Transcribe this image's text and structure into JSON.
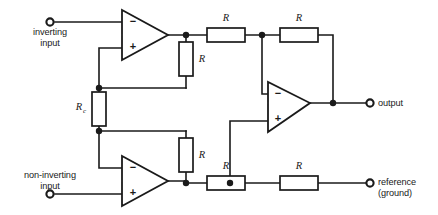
{
  "diagram": {
    "background_color": "#ffffff",
    "line_color": "#1a1a1a"
  },
  "ports": [
    {
      "id": "inverting-input",
      "label": "inverting\ninput",
      "label_lines": [
        "inverting",
        "input"
      ],
      "x": 50,
      "y": 22,
      "label_align": "center"
    },
    {
      "id": "non-inverting-input",
      "label": "non-inverting\ninput",
      "label_lines": [
        "non-inverting",
        "input"
      ],
      "x": 50,
      "y": 194,
      "label_align": "center"
    },
    {
      "id": "output",
      "label": "output",
      "label_lines": [
        "output"
      ],
      "x": 371,
      "y": 103,
      "label_align": "left"
    },
    {
      "id": "reference-ground",
      "label": "reference\n(ground)",
      "label_lines": [
        "reference",
        "(ground)"
      ],
      "x": 371,
      "y": 183,
      "label_align": "left"
    }
  ],
  "opamps": [
    {
      "id": "opamp-top",
      "minus": "−",
      "plus": "+",
      "minus_on_top": true
    },
    {
      "id": "opamp-bottom",
      "minus": "−",
      "plus": "+",
      "minus_on_top": true
    },
    {
      "id": "opamp-output",
      "minus": "−",
      "plus": "+",
      "minus_on_top": true
    }
  ],
  "resistors": [
    {
      "id": "r-top-feedback",
      "label": "R",
      "sub": "",
      "orientation": "vertical"
    },
    {
      "id": "r-gain",
      "label": "R",
      "sub": "c",
      "orientation": "vertical"
    },
    {
      "id": "r-bottom-feedback",
      "label": "R",
      "sub": "",
      "orientation": "vertical"
    },
    {
      "id": "r-top-input",
      "label": "R",
      "sub": "",
      "orientation": "horizontal"
    },
    {
      "id": "r-top-feedback-2",
      "label": "R",
      "sub": "",
      "orientation": "horizontal"
    },
    {
      "id": "r-bottom-input",
      "label": "R",
      "sub": "",
      "orientation": "horizontal"
    },
    {
      "id": "r-bottom-ref",
      "label": "R",
      "sub": "",
      "orientation": "horizontal"
    }
  ]
}
